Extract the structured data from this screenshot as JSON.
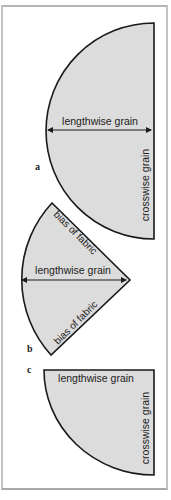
{
  "colors": {
    "fill": "#dcdcdc",
    "stroke": "#1a1a1a",
    "text": "#222222",
    "frame": "#b8b8b8"
  },
  "figures": [
    {
      "id": "a",
      "label": "a",
      "shape": "semicircle",
      "horizontal_label": "lengthwise grain",
      "vertical_label": "crosswise grain"
    },
    {
      "id": "b",
      "label": "b",
      "shape": "wedge",
      "top_edge_label": "bias of fabric",
      "horizontal_label": "lengthwise grain",
      "bottom_edge_label": "bias of fabric"
    },
    {
      "id": "c",
      "label": "c",
      "shape": "quarter-circle",
      "horizontal_label": "lengthwise grain",
      "vertical_label": "crosswise grain"
    }
  ]
}
